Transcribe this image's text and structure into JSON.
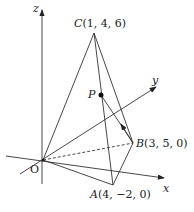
{
  "diagram": {
    "type": "3d-pyramid",
    "axes": {
      "x": "x",
      "y": "y",
      "z": "z",
      "origin": "O"
    },
    "points": {
      "C": {
        "name": "C",
        "coords": "(1, 4, 6)"
      },
      "B": {
        "name": "B",
        "coords": "(3, 5, 0)"
      },
      "A": {
        "name": "A",
        "coords": "(4, −2, 0)"
      },
      "P": {
        "name": "P"
      }
    },
    "colors": {
      "line": "#333333",
      "text": "#222222"
    }
  }
}
